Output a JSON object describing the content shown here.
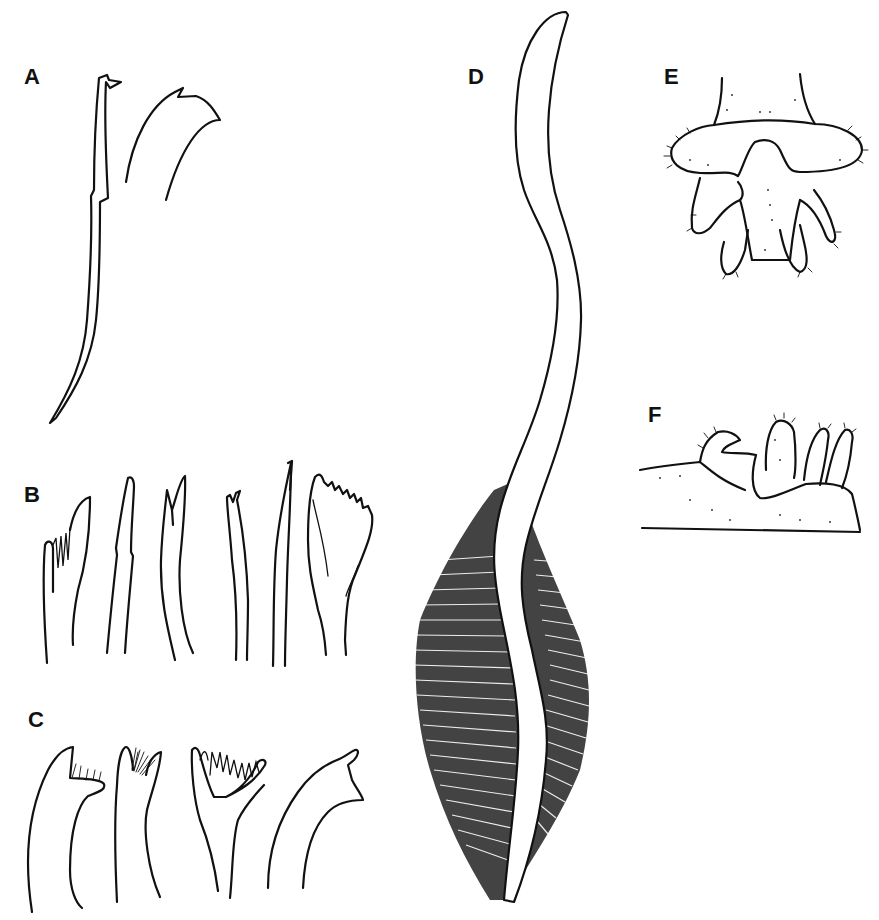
{
  "figure": {
    "background": "#ffffff",
    "ink_color": "#111111",
    "panels": [
      {
        "label": "A",
        "content": "two hook-shaped chaetae (bidentate tips)"
      },
      {
        "label": "B",
        "content": "six chaetae: pectinate, capillary, bifid, serrate fan-shaped"
      },
      {
        "label": "C",
        "content": "four uncini with dentate crests"
      },
      {
        "label": "D",
        "content": "elongate body with dense fringed/ciliated posterior region"
      },
      {
        "label": "E",
        "content": "pygidium ventral view with papillae (hairy fringe)"
      },
      {
        "label": "F",
        "content": "pygidium lateral view with papillae"
      }
    ]
  }
}
